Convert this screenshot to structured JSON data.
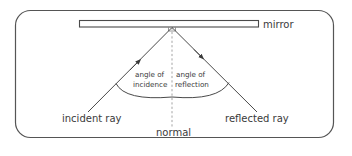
{
  "diagram": {
    "type": "law-of-reflection",
    "labels": {
      "mirror": "mirror",
      "incident_ray": "incident ray",
      "reflected_ray": "reflected ray",
      "normal": "normal",
      "angle_incidence_line1": "angle of",
      "angle_incidence_line2": "incidence",
      "angle_reflection_line1": "angle of",
      "angle_reflection_line2": "reflection"
    },
    "colors": {
      "frame": "#555555",
      "line": "#4a4a4a",
      "normal_dash": "#9a9a9a",
      "text": "#3a3a3a",
      "mirror_fill": "#ffffff"
    }
  }
}
